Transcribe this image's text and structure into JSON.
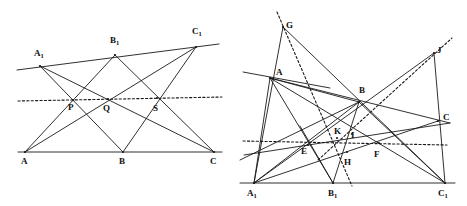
{
  "figure": {
    "caption": "",
    "stroke_color": "#1a1a1a",
    "background": "#ffffff"
  },
  "diagrams": [
    {
      "id": "left-diagram",
      "name": "pappus-configuration-left",
      "labels": [
        {
          "id": "A1",
          "text": "A",
          "sub": "1",
          "x": 34,
          "y": 49
        },
        {
          "id": "B1",
          "text": "B",
          "sub": "1",
          "x": 110,
          "y": 36
        },
        {
          "id": "C1",
          "text": "C",
          "sub": "1",
          "x": 192,
          "y": 27
        },
        {
          "id": "P",
          "text": "P",
          "sub": "",
          "x": 68,
          "y": 103
        },
        {
          "id": "Q",
          "text": "Q",
          "sub": "",
          "x": 103,
          "y": 104
        },
        {
          "id": "S",
          "text": "S",
          "sub": "",
          "x": 153,
          "y": 104
        },
        {
          "id": "A",
          "text": "A",
          "sub": "",
          "x": 21,
          "y": 157
        },
        {
          "id": "B",
          "text": "B",
          "sub": "",
          "x": 119,
          "y": 157
        },
        {
          "id": "C",
          "text": "C",
          "sub": "",
          "x": 210,
          "y": 157
        }
      ],
      "points": {
        "A1": [
          40,
          66
        ],
        "B1": [
          115,
          55
        ],
        "C1": [
          196,
          47
        ],
        "A": [
          25,
          152
        ],
        "B": [
          123,
          152
        ],
        "C": [
          214,
          152
        ],
        "P": [
          73,
          100
        ],
        "Q": [
          108,
          99
        ],
        "S": [
          157,
          98
        ]
      },
      "solid_segments": [
        {
          "name": "line-A1-C1-top",
          "from": [
            17,
            70
          ],
          "to": [
            219,
            44
          ]
        },
        {
          "name": "line-A-C-bottom",
          "from": [
            18,
            152
          ],
          "to": [
            222,
            152
          ]
        },
        {
          "name": "line-A1-B",
          "from": [
            40,
            66
          ],
          "to": [
            123,
            152
          ]
        },
        {
          "name": "line-A1-C",
          "from": [
            40,
            66
          ],
          "to": [
            214,
            152
          ]
        },
        {
          "name": "line-B1-A",
          "from": [
            115,
            55
          ],
          "to": [
            25,
            152
          ]
        },
        {
          "name": "line-B1-C",
          "from": [
            115,
            55
          ],
          "to": [
            214,
            152
          ]
        },
        {
          "name": "line-C1-A",
          "from": [
            196,
            47
          ],
          "to": [
            25,
            152
          ]
        },
        {
          "name": "line-C1-B",
          "from": [
            196,
            47
          ],
          "to": [
            123,
            152
          ]
        }
      ],
      "dotted_segments": [
        {
          "name": "pappus-line-PQS",
          "from": [
            18,
            101
          ],
          "to": [
            222,
            97
          ]
        }
      ]
    },
    {
      "id": "right-diagram",
      "name": "projective-configuration-right",
      "labels": [
        {
          "id": "G",
          "text": "G",
          "sub": "",
          "x": 286,
          "y": 21
        },
        {
          "id": "J",
          "text": "J",
          "sub": "",
          "x": 437,
          "y": 46
        },
        {
          "id": "A",
          "text": "A",
          "sub": "",
          "x": 276,
          "y": 68
        },
        {
          "id": "B",
          "text": "B",
          "sub": "",
          "x": 359,
          "y": 86
        },
        {
          "id": "C",
          "text": "C",
          "sub": "",
          "x": 443,
          "y": 113
        },
        {
          "id": "K",
          "text": "K",
          "sub": "",
          "x": 334,
          "y": 127
        },
        {
          "id": "I",
          "text": "I",
          "sub": "",
          "x": 351,
          "y": 131
        },
        {
          "id": "E",
          "text": "E",
          "sub": "",
          "x": 301,
          "y": 147
        },
        {
          "id": "F",
          "text": "F",
          "sub": "",
          "x": 374,
          "y": 150
        },
        {
          "id": "H",
          "text": "H",
          "sub": "",
          "x": 344,
          "y": 158
        },
        {
          "id": "A1",
          "text": "A",
          "sub": "1",
          "x": 247,
          "y": 189
        },
        {
          "id": "B1",
          "text": "B",
          "sub": "1",
          "x": 328,
          "y": 189
        },
        {
          "id": "C1",
          "text": "C",
          "sub": "1",
          "x": 438,
          "y": 189
        }
      ],
      "points": {
        "G": [
          283,
          27
        ],
        "J": [
          434,
          53
        ],
        "A": [
          270,
          78
        ],
        "B": [
          359,
          102
        ],
        "C": [
          438,
          121
        ],
        "K": [
          337,
          138
        ],
        "I": [
          352,
          134
        ],
        "E": [
          308,
          145
        ],
        "F": [
          379,
          143
        ],
        "H": [
          347,
          152
        ],
        "A1": [
          254,
          183
        ],
        "B1": [
          333,
          183
        ],
        "C1": [
          445,
          183
        ]
      },
      "solid_segments": [
        {
          "name": "baseline-A1-C1",
          "from": [
            240,
            183
          ],
          "to": [
            455,
            183
          ]
        },
        {
          "name": "line-through-A",
          "from": [
            243,
            72
          ],
          "to": [
            330,
            88
          ]
        },
        {
          "name": "line-G-A1",
          "from": [
            283,
            27
          ],
          "to": [
            254,
            183
          ]
        },
        {
          "name": "line-G-C1",
          "from": [
            283,
            27
          ],
          "to": [
            445,
            183
          ]
        },
        {
          "name": "line-A-A1",
          "from": [
            270,
            78
          ],
          "to": [
            254,
            183
          ]
        },
        {
          "name": "line-A-B1",
          "from": [
            270,
            78
          ],
          "to": [
            333,
            183
          ]
        },
        {
          "name": "line-A-C1",
          "from": [
            270,
            78
          ],
          "to": [
            445,
            183
          ]
        },
        {
          "name": "line-A-C",
          "from": [
            270,
            78
          ],
          "to": [
            450,
            123
          ]
        },
        {
          "name": "line-A-B",
          "from": [
            270,
            78
          ],
          "to": [
            359,
            102
          ]
        },
        {
          "name": "line-J-A1",
          "from": [
            434,
            53
          ],
          "to": [
            254,
            183
          ]
        },
        {
          "name": "line-J-C1",
          "from": [
            434,
            53
          ],
          "to": [
            445,
            183
          ]
        },
        {
          "name": "line-B-A1",
          "from": [
            359,
            102
          ],
          "to": [
            254,
            183
          ]
        },
        {
          "name": "line-B-B1",
          "from": [
            359,
            102
          ],
          "to": [
            333,
            183
          ]
        },
        {
          "name": "line-B-C1",
          "from": [
            359,
            102
          ],
          "to": [
            445,
            183
          ]
        },
        {
          "name": "line-B-left-extend",
          "from": [
            359,
            102
          ],
          "to": [
            240,
            160
          ]
        },
        {
          "name": "line-C-A1",
          "from": [
            438,
            121
          ],
          "to": [
            254,
            183
          ]
        },
        {
          "name": "line-C-left-extend",
          "from": [
            450,
            123
          ],
          "to": [
            244,
            155
          ]
        },
        {
          "name": "line-B1-E-up",
          "from": [
            333,
            183
          ],
          "to": [
            300,
            126
          ]
        }
      ],
      "dotted_segments": [
        {
          "name": "dotted-horizontal-EF",
          "from": [
            243,
            141
          ],
          "to": [
            447,
            145
          ]
        },
        {
          "name": "dotted-G-H-B1",
          "from": [
            277,
            12
          ],
          "to": [
            352,
            186
          ]
        },
        {
          "name": "dotted-K-B-J",
          "from": [
            318,
            160
          ],
          "to": [
            452,
            38
          ]
        }
      ]
    }
  ]
}
